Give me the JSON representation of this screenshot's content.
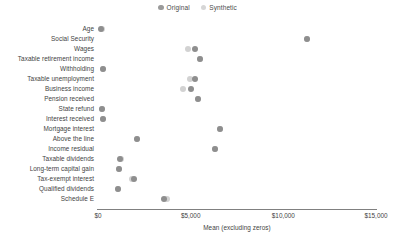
{
  "legend": {
    "position": "top-center",
    "items": [
      {
        "label": "Original",
        "color": "#8e8e8e",
        "key": "original"
      },
      {
        "label": "Synthetic",
        "color": "#d2d2d2",
        "key": "synthetic"
      }
    ]
  },
  "axis": {
    "x_title": "Mean (excluding zeros)",
    "x_ticks": [
      {
        "label": "$0",
        "value": 0
      },
      {
        "label": "$5,000",
        "value": 5000
      },
      {
        "label": "$10,000",
        "value": 10000
      },
      {
        "label": "$15,000",
        "value": 15000
      }
    ],
    "x_min": 0,
    "x_max": 15000
  },
  "chart_data": {
    "type": "scatter",
    "title": "",
    "xlabel": "Mean (excluding zeros)",
    "ylabel": "",
    "xlim": [
      0,
      15000
    ],
    "grid": false,
    "legend_position": "top-center",
    "categories": [
      "Age",
      "Social Security",
      "Wages",
      "Taxable retirement income",
      "Withholding",
      "Taxable unemployment",
      "Business income",
      "Pension received",
      "State refund",
      "Interest received",
      "Mortgage interest",
      "Above the line",
      "Income residual",
      "Taxable dividends",
      "Long-term capital gain",
      "Tax-exempt interest",
      "Qualified dividends",
      "Schedule E"
    ],
    "series": [
      {
        "name": "Original",
        "color": "#8e8e8e",
        "values": [
          180,
          11300,
          5250,
          5500,
          260,
          5250,
          5000,
          5400,
          230,
          250,
          6600,
          2100,
          6300,
          1200,
          1150,
          1950,
          1100,
          3550
        ]
      },
      {
        "name": "Synthetic",
        "color": "#d2d2d2",
        "values": [
          190,
          11300,
          4850,
          5500,
          270,
          4950,
          4600,
          5400,
          240,
          260,
          6600,
          2100,
          6300,
          1250,
          1150,
          1850,
          1100,
          3700
        ]
      }
    ]
  }
}
